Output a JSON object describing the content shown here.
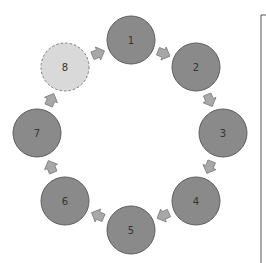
{
  "diagram": {
    "type": "cycle",
    "colors": {
      "node_fill": "#8a8a8a",
      "node_stroke": "#5e5e5e",
      "ghost_fill": "#d9d9d9",
      "ghost_stroke": "#7a7a7a",
      "arrow_fill": "#a8a8a8",
      "arrow_stroke": "#7e7e7e",
      "bracket": "#555555"
    },
    "nodes": [
      {
        "id": "1",
        "label": "1",
        "cx": 131,
        "cy": 40,
        "style": "solid"
      },
      {
        "id": "2",
        "label": "2",
        "cx": 196,
        "cy": 67,
        "style": "solid"
      },
      {
        "id": "3",
        "label": "3",
        "cx": 223,
        "cy": 133,
        "style": "solid"
      },
      {
        "id": "4",
        "label": "4",
        "cx": 196,
        "cy": 201,
        "style": "solid"
      },
      {
        "id": "5",
        "label": "5",
        "cx": 131,
        "cy": 230,
        "style": "solid"
      },
      {
        "id": "6",
        "label": "6",
        "cx": 65,
        "cy": 201,
        "style": "solid"
      },
      {
        "id": "7",
        "label": "7",
        "cx": 37,
        "cy": 133,
        "style": "solid"
      },
      {
        "id": "8",
        "label": "8",
        "cx": 65,
        "cy": 67,
        "style": "dashed"
      }
    ],
    "edges": [
      {
        "from": "1",
        "to": "2"
      },
      {
        "from": "2",
        "to": "3"
      },
      {
        "from": "3",
        "to": "4"
      },
      {
        "from": "4",
        "to": "5"
      },
      {
        "from": "5",
        "to": "6"
      },
      {
        "from": "6",
        "to": "7"
      },
      {
        "from": "7",
        "to": "8"
      },
      {
        "from": "8",
        "to": "1"
      }
    ]
  }
}
